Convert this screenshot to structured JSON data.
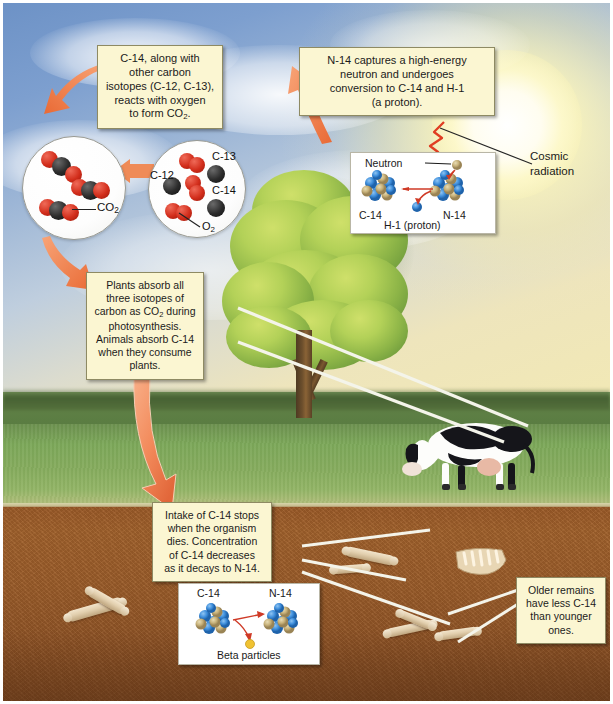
{
  "callouts": {
    "co2_formation": "C-14, along with other carbon isotopes (C-12, C-13), reacts with oxygen to form CO₂.",
    "co2_formation_lines": [
      "C-14, along with",
      "other carbon",
      "isotopes (C-12, C-13),",
      "reacts with oxygen",
      "to form CO"
    ],
    "n14_capture": "N-14 captures a high-energy neutron and undergoes conversion to C-14 and H-1 (a proton).",
    "n14_capture_lines": [
      "N-14 captures a high-energy",
      "neutron and undergoes",
      "conversion to C-14 and H-1",
      "(a proton)."
    ],
    "plants_absorb_lines": [
      "Plants absorb all",
      "three isotopes of",
      "carbon as CO",
      " during",
      "photosynthesis.",
      "Animals absorb C-14",
      "when they consume",
      "plants."
    ],
    "plants_absorb": "Plants absorb all three isotopes of carbon as CO₂ during photosynthesis. Animals absorb C-14 when they consume plants.",
    "intake_stops_lines": [
      "Intake of C-14 stops",
      "when the organism",
      "dies. Concentration",
      "of C-14 decreases",
      "as it decays to N-14."
    ],
    "intake_stops": "Intake of C-14 stops when the organism dies. Concentration of C-14 decreases as it decays to N-14.",
    "older_remains_lines": [
      "Older remains",
      "have less C-14",
      "than younger",
      "ones."
    ],
    "older_remains": "Older remains have less C-14 than younger ones."
  },
  "labels": {
    "cosmic_radiation_line1": "Cosmic",
    "cosmic_radiation_line2": "radiation",
    "cosmic_radiation": "Cosmic radiation",
    "neutron": "Neutron",
    "c14": "C-14",
    "n14": "N-14",
    "h1_proton": "H-1 (proton)",
    "beta_particles": "Beta particles",
    "co2": "CO",
    "co2_sub": "2",
    "o2": "O",
    "o2_sub": "2",
    "c12": "C-12",
    "c13": "C-13",
    "c14_iso": "C-14"
  },
  "colors": {
    "callout_bg": "#fbf6d2",
    "callout_border": "#8e8a63",
    "arrow_orange": "#ef7f4e",
    "nucleus_blue": "#3f8fdc",
    "nucleus_tan": "#c8b27a",
    "carbon_black": "#1f1f1f",
    "oxygen_red": "#d22d1b",
    "cosmic_red": "#e03d22",
    "grass_green": "#86ac5e",
    "soil_brown": "#9b5a28",
    "sky_blue": "#7d9fcf",
    "sun_yellow": "#fff8c8",
    "beta_yellow": "#f0c232"
  },
  "scene": {
    "sky": "sky-with-sun-and-clouds",
    "tree": "deciduous-tree",
    "cow": "grazing-holstein-cow",
    "ground": "grass-field",
    "subsurface": "soil-with-buried-bones"
  }
}
